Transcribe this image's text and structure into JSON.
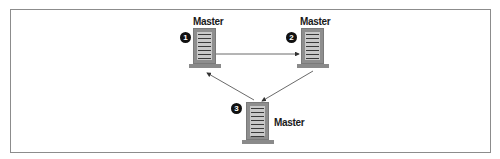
{
  "diagram": {
    "type": "master-master ring replication",
    "nodes": [
      {
        "id": 1,
        "badge": "1",
        "label": "Master"
      },
      {
        "id": 2,
        "badge": "2",
        "label": "Master"
      },
      {
        "id": 3,
        "badge": "3",
        "label": "Master"
      }
    ],
    "edges": [
      {
        "from": 1,
        "to": 2
      },
      {
        "from": 2,
        "to": 3
      },
      {
        "from": 3,
        "to": 1
      }
    ],
    "colors": {
      "border": "#8c8c8c",
      "server_body": "#8e8e8e",
      "server_panel": "#c9c9c9",
      "badge": "#111111",
      "arrow": "#333333"
    }
  }
}
